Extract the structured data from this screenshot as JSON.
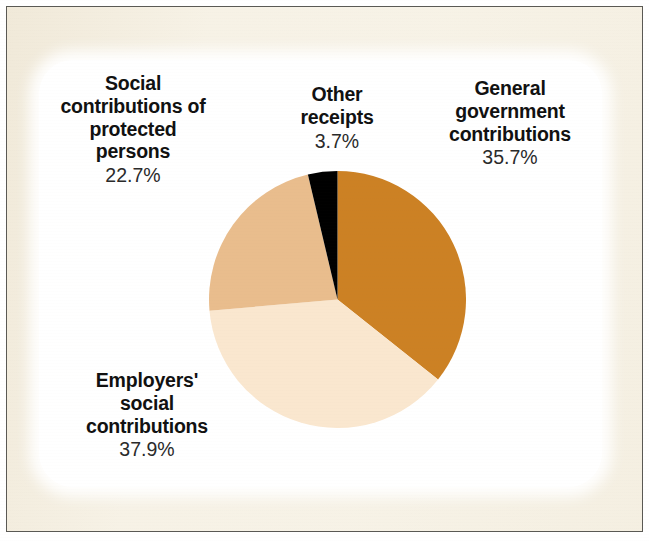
{
  "figure": {
    "background_color": "#f6f1e4",
    "card_color": "#ffffff",
    "frame_color": "#5a5954"
  },
  "chart_data": {
    "type": "pie",
    "title": "",
    "subtitle": "",
    "xlabel": "",
    "ylabel": "",
    "legend_position": "none",
    "labels_position": "around-pie",
    "units": "percent",
    "total": 100.0,
    "start_angle_deg": 0,
    "direction": "clockwise",
    "categories": [
      "General government contributions",
      "Employers' social contributions",
      "Social contributions of protected persons",
      "Other receipts"
    ],
    "values": [
      35.7,
      37.9,
      22.7,
      3.7
    ],
    "colors": [
      "#cc8124",
      "#fae7cf",
      "#e9bd8d",
      "#000000"
    ],
    "slices": [
      {
        "name": "General government contributions",
        "label_line1": "General",
        "label_line2": "government",
        "label_line3": "contributions",
        "value": 35.7,
        "value_text": "35.7%",
        "color": "#cc8124",
        "start_deg": 0.0,
        "end_deg": 128.52
      },
      {
        "name": "Employers' social contributions",
        "label_line1": "Employers'",
        "label_line2": "social",
        "label_line3": "contributions",
        "value": 37.9,
        "value_text": "37.9%",
        "color": "#fae7cf",
        "start_deg": 128.52,
        "end_deg": 264.96
      },
      {
        "name": "Social contributions of protected persons",
        "label_line1": "Social",
        "label_line2": "contributions of",
        "label_line3": "protected",
        "label_line4": "persons",
        "value": 22.7,
        "value_text": "22.7%",
        "color": "#e9bd8d",
        "start_deg": 264.96,
        "end_deg": 346.68
      },
      {
        "name": "Other receipts",
        "label_line1": "Other",
        "label_line2": "receipts",
        "value": 3.7,
        "value_text": "3.7%",
        "color": "#000000",
        "start_deg": 346.68,
        "end_deg": 360.0
      }
    ]
  },
  "labels": {
    "protected": {
      "line1": "Social",
      "line2": "contributions of",
      "line3": "protected",
      "line4": "persons",
      "pct": "22.7%"
    },
    "other": {
      "line1": "Other",
      "line2": "receipts",
      "pct": "3.7%"
    },
    "government": {
      "line1": "General",
      "line2": "government",
      "line3": "contributions",
      "pct": "35.7%"
    },
    "employers": {
      "line1": "Employers'",
      "line2": "social",
      "line3": "contributions",
      "pct": "37.9%"
    }
  }
}
